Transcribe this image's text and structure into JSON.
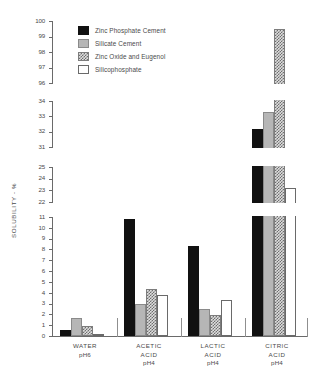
{
  "chart_data": {
    "type": "bar",
    "title": "",
    "xlabel": "",
    "ylabel": "SOLUBILITY - %",
    "categories": [
      "WATER",
      "ACETIC ACID",
      "LACTIC ACID",
      "CITRIC ACID"
    ],
    "category_sub": [
      "pH6",
      "pH4",
      "pH4",
      "pH4"
    ],
    "grid": false,
    "legend_position": "top-right",
    "axis_broken": true,
    "y_segments": [
      {
        "min": 0,
        "max": 11,
        "ticks": [
          0,
          1,
          2,
          3,
          4,
          5,
          6,
          7,
          8,
          9,
          10,
          11
        ]
      },
      {
        "min": 22,
        "max": 25,
        "ticks": [
          22,
          23,
          24,
          25
        ]
      },
      {
        "min": 31,
        "max": 34,
        "ticks": [
          31,
          32,
          33,
          34
        ]
      },
      {
        "min": 96,
        "max": 100,
        "ticks": [
          96,
          97,
          98,
          99,
          100
        ]
      }
    ],
    "series": [
      {
        "name": "Zinc Phosphate Cement",
        "fill": "black",
        "values": [
          0.6,
          10.8,
          8.3,
          32.2
        ]
      },
      {
        "name": "Silicate Cement",
        "fill": "grey",
        "values": [
          1.7,
          3.0,
          2.5,
          33.3
        ]
      },
      {
        "name": "Zinc Oxide and Eugenol",
        "fill": "check",
        "values": [
          0.9,
          4.3,
          1.9,
          99.5
        ]
      },
      {
        "name": "Silicophosphate",
        "fill": "white",
        "values": [
          0.2,
          3.8,
          3.3,
          23.2
        ]
      }
    ]
  },
  "legend": {
    "items": [
      {
        "label": "Zinc Phosphate Cement"
      },
      {
        "label": "Silicate Cement"
      },
      {
        "label": "Zinc Oxide and Eugenol"
      },
      {
        "label": "Silicophosphate"
      }
    ]
  },
  "axis": {
    "y_title": "SOLUBILITY - %",
    "tick_labels": [
      "100",
      "99",
      "98",
      "97",
      "96",
      "34",
      "33",
      "32",
      "31",
      "25",
      "24",
      "23",
      "22",
      "11",
      "10",
      "9",
      "8",
      "7",
      "6",
      "5",
      "4",
      "3",
      "2",
      "1",
      "0"
    ]
  },
  "groups": [
    {
      "name": "WATER",
      "ph": "pH6"
    },
    {
      "name": "ACETIC",
      "name2": "ACID",
      "ph": "pH4"
    },
    {
      "name": "LACTIC",
      "name2": "ACID",
      "ph": "pH4"
    },
    {
      "name": "CITRIC",
      "name2": "ACID",
      "ph": "pH4"
    }
  ]
}
